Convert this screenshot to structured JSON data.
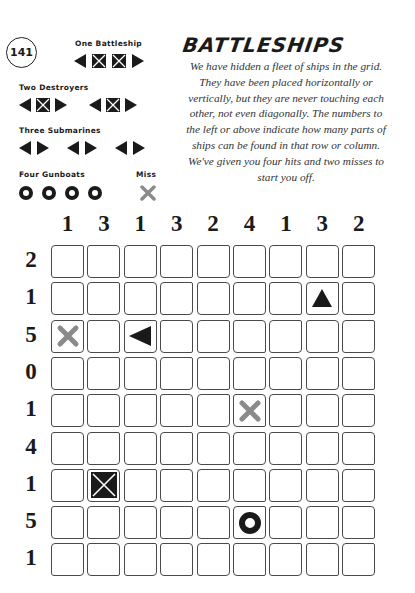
{
  "puzzle_number": "141",
  "title": "BATTLESHIPS",
  "instructions": "We have hidden a fleet of ships in the grid. They have been placed horizontally or vertically, but they are never touching each other, not even diagonally. The numbers to the left or above indicate how many parts of ships can be found in that row or column. We've given you four hits and two misses to start you off.",
  "fleet": {
    "battleship": {
      "label": "One Battleship",
      "count": 1,
      "length": 4
    },
    "destroyers": {
      "label": "Two Destroyers",
      "count": 2,
      "length": 3
    },
    "submarines": {
      "label": "Three Submarines",
      "count": 3,
      "length": 2
    },
    "gunboats": {
      "label": "Four Gunboats",
      "count": 4,
      "length": 1
    },
    "miss": {
      "label": "Miss"
    }
  },
  "colors": {
    "ink": "#1a1a1a",
    "miss": "#8a8a8a",
    "cell_border": "#4a4a4a"
  },
  "grid": {
    "rows": 9,
    "cols": 9,
    "column_clues": [
      "1",
      "3",
      "1",
      "3",
      "2",
      "4",
      "1",
      "3",
      "2"
    ],
    "row_clues": [
      "2",
      "1",
      "5",
      "0",
      "1",
      "4",
      "1",
      "5",
      "1"
    ],
    "given": [
      {
        "row": 2,
        "col": 8,
        "type": "ship-end-top"
      },
      {
        "row": 3,
        "col": 1,
        "type": "miss"
      },
      {
        "row": 3,
        "col": 3,
        "type": "ship-end-left"
      },
      {
        "row": 5,
        "col": 6,
        "type": "miss"
      },
      {
        "row": 7,
        "col": 2,
        "type": "ship-middle"
      },
      {
        "row": 8,
        "col": 6,
        "type": "gunboat"
      }
    ]
  }
}
